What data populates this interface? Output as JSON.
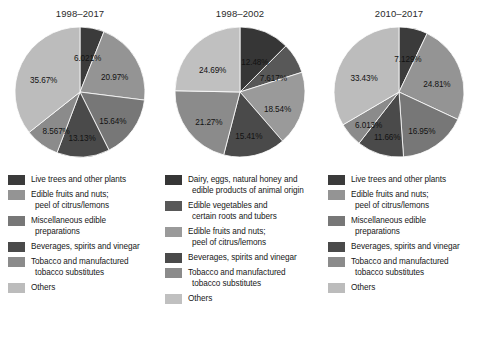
{
  "chart_data": [
    {
      "type": "pie",
      "title": "1998–2017",
      "labels": [
        "Live trees and other plants",
        "Edible fruits and nuts; peel of citrus/lemons",
        "Miscellaneous edible preparations",
        "Beverages, spirits and vinegar",
        "Tobacco and manufactured tobacco substitutes",
        "Others"
      ],
      "values": [
        6.021,
        20.97,
        15.64,
        13.13,
        8.567,
        35.67
      ],
      "value_labels": [
        "6.021%",
        "20.97%",
        "15.64%",
        "13.13%",
        "8.567%",
        "35.67%"
      ],
      "colors": [
        "#3b3b3b",
        "#949494",
        "#777777",
        "#4a4a4a",
        "#8b8b8b",
        "#bcbcbc"
      ],
      "legend_position": "below"
    },
    {
      "type": "pie",
      "title": "1998–2002",
      "labels": [
        "Dairy, eggs, natural honey and edible products of animal origin",
        "Edible vegetables and certain roots and tubers",
        "Edible fruits and nuts; peel of citrus/lemons",
        "Beverages, spirits and vinegar",
        "Tobacco and manufactured tobacco substitutes",
        "Others"
      ],
      "values": [
        12.48,
        7.617,
        18.54,
        15.41,
        21.27,
        24.69
      ],
      "value_labels": [
        "12.48%",
        "7.617%",
        "18.54%",
        "15.41%",
        "21.27%",
        "24.69%"
      ],
      "colors": [
        "#363636",
        "#585858",
        "#9a9a9a",
        "#4a4a4a",
        "#8b8b8b",
        "#c0c0c0"
      ],
      "legend_position": "below"
    },
    {
      "type": "pie",
      "title": "2010–2017",
      "labels": [
        "Live trees and other plants",
        "Edible fruits and nuts; peel of citrus/lemons",
        "Miscellaneous edible preparations",
        "Beverages, spirits and vinegar",
        "Tobacco and manufactured tobacco substitutes",
        "Others"
      ],
      "values": [
        7.129,
        24.81,
        16.95,
        11.66,
        6.013,
        33.43
      ],
      "value_labels": [
        "7.129%",
        "24.81%",
        "16.95%",
        "11.66%",
        "6.013%",
        "33.43%"
      ],
      "colors": [
        "#3b3b3b",
        "#949494",
        "#777777",
        "#4a4a4a",
        "#8b8b8b",
        "#bcbcbc"
      ],
      "legend_position": "below"
    }
  ],
  "panels": [
    {
      "title": "1998–2017",
      "legend": [
        {
          "color": "#3b3b3b",
          "line1": "Live trees and other plants",
          "line2": ""
        },
        {
          "color": "#949494",
          "line1": "Edible fruits and nuts;",
          "line2": "peel of citrus/lemons"
        },
        {
          "color": "#777777",
          "line1": "Miscellaneous edible",
          "line2": "preparations"
        },
        {
          "color": "#4a4a4a",
          "line1": "Beverages, spirits and vinegar",
          "line2": ""
        },
        {
          "color": "#8b8b8b",
          "line1": "Tobacco and manufactured",
          "line2": "tobacco substitutes"
        },
        {
          "color": "#bcbcbc",
          "line1": "Others",
          "line2": ""
        }
      ]
    },
    {
      "title": "1998–2002",
      "legend": [
        {
          "color": "#363636",
          "line1": "Dairy, eggs, natural honey and",
          "line2": "edible products of animal origin"
        },
        {
          "color": "#585858",
          "line1": "Edible vegetables and",
          "line2": "certain roots and tubers"
        },
        {
          "color": "#9a9a9a",
          "line1": "Edible fruits and nuts;",
          "line2": "peel of citrus/lemons"
        },
        {
          "color": "#4a4a4a",
          "line1": "Beverages, spirits and vinegar",
          "line2": ""
        },
        {
          "color": "#8b8b8b",
          "line1": "Tobacco and manufactured",
          "line2": "tobacco substitutes"
        },
        {
          "color": "#c0c0c0",
          "line1": "Others",
          "line2": ""
        }
      ]
    },
    {
      "title": "2010–2017",
      "legend": [
        {
          "color": "#3b3b3b",
          "line1": "Live trees and other plants",
          "line2": ""
        },
        {
          "color": "#949494",
          "line1": "Edible fruits and nuts;",
          "line2": "peel of citrus/lemons"
        },
        {
          "color": "#777777",
          "line1": "Miscellaneous edible",
          "line2": "preparations"
        },
        {
          "color": "#4a4a4a",
          "line1": "Beverages, spirits and vinegar",
          "line2": ""
        },
        {
          "color": "#8b8b8b",
          "line1": "Tobacco and manufactured",
          "line2": "tobacco substitutes"
        },
        {
          "color": "#bcbcbc",
          "line1": "Others",
          "line2": ""
        }
      ]
    }
  ]
}
